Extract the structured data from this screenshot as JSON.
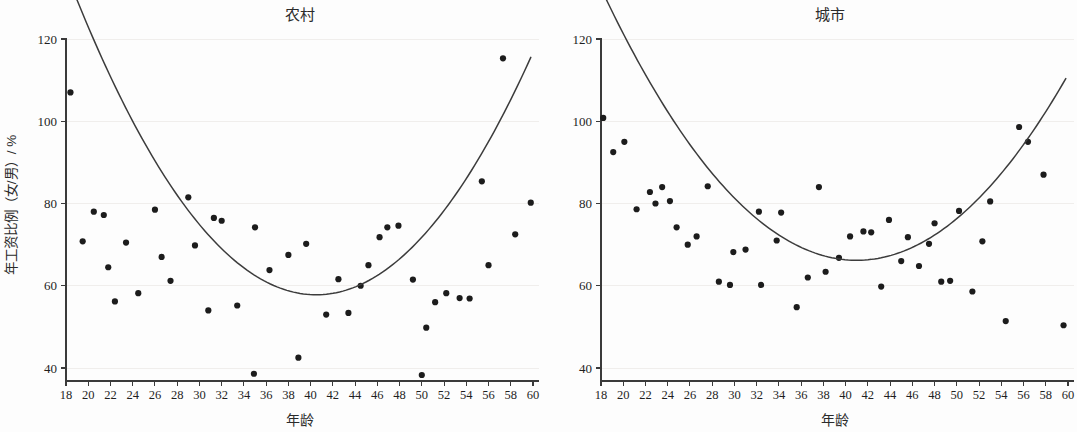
{
  "figure": {
    "background": "#fdfdfd",
    "point_color": "#1c1c1c",
    "line_color": "#3c3c3c",
    "axis_color": "#3a3a3a"
  },
  "axis_titles": {
    "x": "年龄",
    "y": "年工资比例（女/男）/ %"
  },
  "panels": [
    {
      "id": "rural",
      "title": "农村"
    },
    {
      "id": "urban",
      "title": "城市"
    }
  ],
  "chart_data": [
    {
      "type": "scatter",
      "title": "农村",
      "xlabel": "年龄",
      "ylabel": "年工资比例（女/男）/ %",
      "xlim": [
        17,
        61
      ],
      "ylim": [
        34,
        122
      ],
      "xticks": [
        18,
        20,
        22,
        24,
        26,
        28,
        30,
        32,
        34,
        36,
        38,
        40,
        42,
        44,
        46,
        48,
        50,
        52,
        54,
        56,
        58,
        60
      ],
      "yticks": [
        40,
        60,
        80,
        100,
        120
      ],
      "grid": true,
      "legend": "none",
      "points": [
        {
          "x": 18.4,
          "y": 107.0
        },
        {
          "x": 19.5,
          "y": 70.8
        },
        {
          "x": 20.5,
          "y": 78.0
        },
        {
          "x": 21.4,
          "y": 77.2
        },
        {
          "x": 21.8,
          "y": 64.5
        },
        {
          "x": 22.4,
          "y": 56.2
        },
        {
          "x": 23.4,
          "y": 70.5
        },
        {
          "x": 24.5,
          "y": 58.2
        },
        {
          "x": 26.0,
          "y": 78.5
        },
        {
          "x": 26.6,
          "y": 67.0
        },
        {
          "x": 27.4,
          "y": 61.2
        },
        {
          "x": 29.0,
          "y": 81.5
        },
        {
          "x": 29.6,
          "y": 69.8
        },
        {
          "x": 30.8,
          "y": 54.0
        },
        {
          "x": 31.3,
          "y": 76.5
        },
        {
          "x": 32.0,
          "y": 75.8
        },
        {
          "x": 33.4,
          "y": 55.2
        },
        {
          "x": 34.9,
          "y": 38.6
        },
        {
          "x": 35.0,
          "y": 74.2
        },
        {
          "x": 36.3,
          "y": 63.8
        },
        {
          "x": 38.0,
          "y": 67.5
        },
        {
          "x": 38.9,
          "y": 42.5
        },
        {
          "x": 39.6,
          "y": 70.2
        },
        {
          "x": 41.4,
          "y": 53.0
        },
        {
          "x": 42.5,
          "y": 61.6
        },
        {
          "x": 43.4,
          "y": 53.4
        },
        {
          "x": 44.5,
          "y": 60.0
        },
        {
          "x": 45.2,
          "y": 65.0
        },
        {
          "x": 46.2,
          "y": 71.8
        },
        {
          "x": 46.9,
          "y": 74.2
        },
        {
          "x": 47.9,
          "y": 74.6
        },
        {
          "x": 49.2,
          "y": 61.5
        },
        {
          "x": 50.0,
          "y": 38.3
        },
        {
          "x": 50.4,
          "y": 49.8
        },
        {
          "x": 51.2,
          "y": 56.0
        },
        {
          "x": 52.2,
          "y": 58.2
        },
        {
          "x": 53.4,
          "y": 57.0
        },
        {
          "x": 54.3,
          "y": 56.9
        },
        {
          "x": 55.4,
          "y": 85.4
        },
        {
          "x": 56.0,
          "y": 65.0
        },
        {
          "x": 57.3,
          "y": 115.3
        },
        {
          "x": 58.4,
          "y": 72.5
        },
        {
          "x": 59.8,
          "y": 80.2
        }
      ],
      "fit_curve": {
        "kind": "quadratic",
        "x_start": 18.3,
        "x_end": 59.8,
        "vertex_x": 40.5,
        "vertex_y": 57.8,
        "curvature": 0.0155
      }
    },
    {
      "type": "scatter",
      "title": "城市",
      "xlabel": "年龄",
      "ylabel": "年工资比例（女/男）/ %",
      "xlim": [
        17,
        61
      ],
      "ylim": [
        34,
        122
      ],
      "xticks": [
        18,
        20,
        22,
        24,
        26,
        28,
        30,
        32,
        34,
        36,
        38,
        40,
        42,
        44,
        46,
        48,
        50,
        52,
        54,
        56,
        58,
        60
      ],
      "yticks": [
        40,
        60,
        80,
        100,
        120
      ],
      "grid": true,
      "legend": "none",
      "points": [
        {
          "x": 18.2,
          "y": 100.8
        },
        {
          "x": 19.1,
          "y": 92.5
        },
        {
          "x": 20.1,
          "y": 95.0
        },
        {
          "x": 21.2,
          "y": 78.6
        },
        {
          "x": 22.4,
          "y": 82.8
        },
        {
          "x": 22.9,
          "y": 80.0
        },
        {
          "x": 23.5,
          "y": 84.0
        },
        {
          "x": 24.2,
          "y": 80.6
        },
        {
          "x": 24.8,
          "y": 74.2
        },
        {
          "x": 25.8,
          "y": 70.0
        },
        {
          "x": 26.6,
          "y": 72.0
        },
        {
          "x": 27.6,
          "y": 84.2
        },
        {
          "x": 28.6,
          "y": 61.0
        },
        {
          "x": 29.6,
          "y": 60.2
        },
        {
          "x": 29.9,
          "y": 68.2
        },
        {
          "x": 31.0,
          "y": 68.8
        },
        {
          "x": 32.2,
          "y": 78.0
        },
        {
          "x": 32.4,
          "y": 60.2
        },
        {
          "x": 33.8,
          "y": 71.0
        },
        {
          "x": 34.2,
          "y": 77.8
        },
        {
          "x": 35.6,
          "y": 54.8
        },
        {
          "x": 36.6,
          "y": 62.0
        },
        {
          "x": 37.6,
          "y": 84.0
        },
        {
          "x": 38.2,
          "y": 63.4
        },
        {
          "x": 39.4,
          "y": 66.8
        },
        {
          "x": 40.4,
          "y": 72.0
        },
        {
          "x": 41.6,
          "y": 73.2
        },
        {
          "x": 42.3,
          "y": 73.0
        },
        {
          "x": 43.2,
          "y": 59.8
        },
        {
          "x": 43.9,
          "y": 76.0
        },
        {
          "x": 45.0,
          "y": 66.0
        },
        {
          "x": 45.6,
          "y": 71.8
        },
        {
          "x": 46.6,
          "y": 64.8
        },
        {
          "x": 47.5,
          "y": 70.2
        },
        {
          "x": 48.0,
          "y": 75.2
        },
        {
          "x": 48.6,
          "y": 61.0
        },
        {
          "x": 49.4,
          "y": 61.2
        },
        {
          "x": 50.2,
          "y": 78.2
        },
        {
          "x": 51.4,
          "y": 58.6
        },
        {
          "x": 52.3,
          "y": 70.8
        },
        {
          "x": 53.0,
          "y": 80.5
        },
        {
          "x": 54.4,
          "y": 51.4
        },
        {
          "x": 55.6,
          "y": 98.6
        },
        {
          "x": 56.4,
          "y": 95.0
        },
        {
          "x": 57.8,
          "y": 87.0
        },
        {
          "x": 59.6,
          "y": 50.4
        }
      ],
      "fit_curve": {
        "kind": "quadratic",
        "x_start": 18.3,
        "x_end": 59.8,
        "vertex_x": 41.0,
        "vertex_y": 66.2,
        "curvature": 0.0125
      }
    }
  ]
}
